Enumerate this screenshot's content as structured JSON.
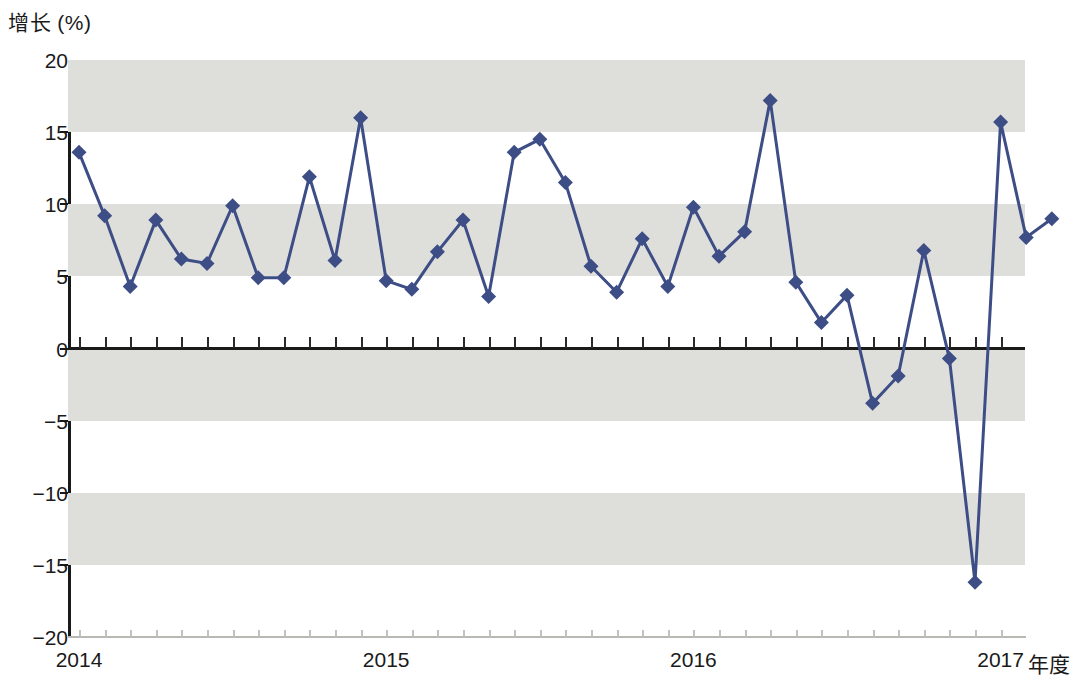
{
  "chart_data": {
    "type": "line",
    "title": "",
    "subtitle": "",
    "ylabel": "增长 (%)",
    "xlabel": "年度",
    "ylim": [
      -20,
      20
    ],
    "ytick_labels": [
      "20",
      "15",
      "10",
      "5",
      "0",
      "-5",
      "-10",
      "-15",
      "-20"
    ],
    "ytick_values": [
      20,
      15,
      10,
      5,
      0,
      -5,
      -10,
      -15,
      -20
    ],
    "xtick_labels": [
      "2014",
      "2015",
      "2016",
      "2017"
    ],
    "xtick_values": [
      0,
      12,
      24,
      36
    ],
    "grid": "horizontal-bands",
    "band_ranges": [
      [
        15,
        20
      ],
      [
        5,
        10
      ],
      [
        -5,
        0
      ],
      [
        -15,
        -10
      ]
    ],
    "legend": [],
    "series": [
      {
        "name": "增长 (%)",
        "color": "#3d4d85",
        "marker": "diamond",
        "x": [
          0,
          1,
          2,
          3,
          4,
          5,
          6,
          7,
          8,
          9,
          10,
          11,
          12,
          13,
          14,
          15,
          16,
          17,
          18,
          19,
          20,
          21,
          22,
          23,
          24,
          25,
          26,
          27,
          28,
          29,
          30,
          31,
          32,
          33,
          34,
          35,
          36,
          37,
          38
        ],
        "values": [
          13.6,
          9.2,
          4.3,
          8.9,
          6.2,
          5.9,
          9.9,
          4.9,
          4.9,
          11.9,
          6.1,
          16.0,
          4.7,
          4.1,
          6.7,
          8.9,
          3.6,
          13.6,
          14.5,
          11.5,
          5.7,
          3.9,
          7.6,
          4.3,
          9.8,
          6.4,
          8.1,
          17.2,
          4.6,
          1.8,
          3.7,
          -3.8,
          -1.9,
          6.8,
          -0.7,
          -16.2,
          15.7,
          7.7,
          9.0
        ]
      }
    ]
  },
  "axis": {
    "y_title": "增长 (%)",
    "x_title": "年度"
  },
  "colors": {
    "series": "#3d4d85",
    "band": "#dededa",
    "axis": "#1a1a1a",
    "background": "#ffffff"
  }
}
